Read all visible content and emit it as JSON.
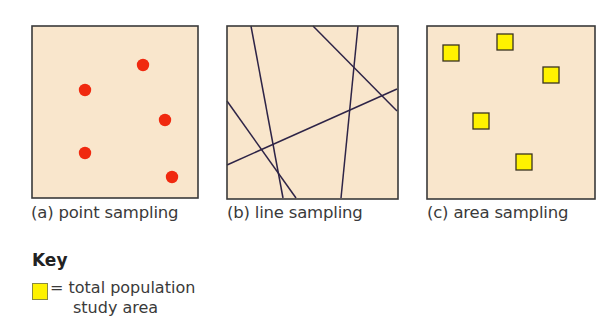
{
  "colors": {
    "background": "#f9e6cc",
    "border": "#3a3a3a",
    "point": "#f0290f",
    "line": "#2e2447",
    "area_fill": "#fff200",
    "area_stroke": "#3a3320"
  },
  "panels": [
    {
      "id": "a",
      "caption": "(a) point sampling",
      "points": [
        {
          "cx": 111,
          "cy": 39
        },
        {
          "cx": 53,
          "cy": 64
        },
        {
          "cx": 133,
          "cy": 94
        },
        {
          "cx": 53,
          "cy": 127
        },
        {
          "cx": 140,
          "cy": 151
        }
      ]
    },
    {
      "id": "b",
      "caption": "(b) line sampling",
      "lines": [
        {
          "x1": 24,
          "y1": 0,
          "x2": 56,
          "y2": 172
        },
        {
          "x1": 86,
          "y1": 0,
          "x2": 170,
          "y2": 85
        },
        {
          "x1": 131,
          "y1": 0,
          "x2": 114,
          "y2": 172
        },
        {
          "x1": 0,
          "y1": 75,
          "x2": 69,
          "y2": 172
        },
        {
          "x1": 0,
          "y1": 139,
          "x2": 170,
          "y2": 63
        }
      ]
    },
    {
      "id": "c",
      "caption": "(c) area sampling",
      "squares": [
        {
          "x": 24,
          "y": 27
        },
        {
          "x": 78,
          "y": 16
        },
        {
          "x": 124,
          "y": 49
        },
        {
          "x": 54,
          "y": 95
        },
        {
          "x": 97,
          "y": 136
        }
      ]
    }
  ],
  "key": {
    "title": "Key",
    "line1": "= total population",
    "line2": "study area"
  }
}
